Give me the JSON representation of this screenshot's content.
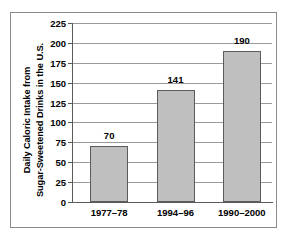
{
  "chart_data": {
    "type": "bar",
    "title": "",
    "subtitle": "",
    "xlabel": "",
    "ylabel_line1": "Daily Caloric Intake from",
    "ylabel_line2": "Sugar-Sweetened Drinks in the U.S.",
    "categories": [
      "1977–78",
      "1994–96",
      "1990–2000"
    ],
    "values": [
      70,
      141,
      190
    ],
    "value_labels": [
      "70",
      "141",
      "190"
    ],
    "ylim": [
      0,
      225
    ],
    "ytick_values": [
      0,
      25,
      50,
      75,
      100,
      125,
      150,
      175,
      200,
      225
    ],
    "ytick_labels": [
      "0",
      "25",
      "50",
      "75",
      "100",
      "125",
      "150",
      "175",
      "200",
      "225"
    ],
    "grid": true,
    "legend": "none",
    "series": [
      {
        "name": "Daily Caloric Intake from Sugar-Sweetened Drinks in the U.S.",
        "values": [
          70,
          141,
          190
        ]
      }
    ],
    "colors": {
      "bar_fill": "#bfbfbf",
      "bar_border": "#5c5c5c",
      "gridline": "#9a9a9a",
      "axis": "#5a5a5a",
      "frame": "#8a8a8a",
      "text": "#000000",
      "background": "#ffffff"
    }
  }
}
